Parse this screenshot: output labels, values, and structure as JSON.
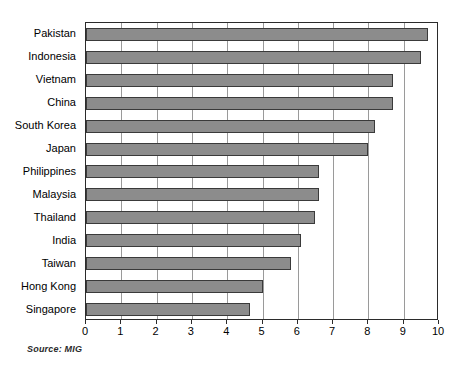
{
  "chart_data": {
    "type": "bar",
    "orientation": "horizontal",
    "title": "",
    "subtitle": "",
    "xlabel": "",
    "ylabel": "",
    "xlim": [
      0,
      10
    ],
    "ylim": null,
    "grid": true,
    "grid_axis": "x",
    "legend": false,
    "legend_position": "none",
    "source_note": "Source: MIG",
    "xticks": [
      0,
      1,
      2,
      3,
      4,
      5,
      6,
      7,
      8,
      9,
      10
    ],
    "xtick_labels": [
      "0",
      "1",
      "2",
      "3",
      "4",
      "5",
      "6",
      "7",
      "8",
      "9",
      "10"
    ],
    "categories": [
      "Pakistan",
      "Indonesia",
      "Vietnam",
      "China",
      "South Korea",
      "Japan",
      "Philippines",
      "Malaysia",
      "Thailand",
      "India",
      "Taiwan",
      "Hong Kong",
      "Singapore"
    ],
    "values": [
      9.7,
      9.5,
      8.7,
      8.7,
      8.2,
      8.0,
      6.6,
      6.6,
      6.5,
      6.1,
      5.8,
      5.0,
      4.65
    ],
    "series": [
      {
        "name": "",
        "values": [
          9.7,
          9.5,
          8.7,
          8.7,
          8.2,
          8.0,
          6.6,
          6.6,
          6.5,
          6.1,
          5.8,
          5.0,
          4.65
        ]
      }
    ],
    "bar_color": "#8c8c8c",
    "bar_edge_color": "#3a3a3a",
    "frame_color": "#2b2b2b",
    "gridline_color": "#9a9a9a",
    "background_color": "#ffffff"
  }
}
